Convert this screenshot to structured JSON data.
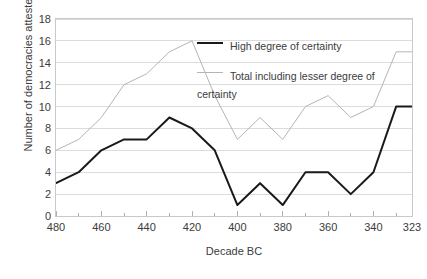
{
  "chart_data": {
    "type": "line",
    "title": "",
    "xlabel": "Decade BC",
    "ylabel": "Number of democracies attested",
    "xlim": [
      480,
      323
    ],
    "ylim": [
      0,
      18
    ],
    "ytick_step": 2,
    "grid": "horizontal",
    "legend_position": "inside-top-right",
    "x": [
      480,
      470,
      460,
      450,
      440,
      430,
      420,
      410,
      400,
      390,
      380,
      370,
      360,
      350,
      340,
      330,
      323
    ],
    "xtick_labels": [
      "480",
      "460",
      "440",
      "420",
      "400",
      "380",
      "360",
      "340",
      "323"
    ],
    "xtick_values": [
      480,
      460,
      440,
      420,
      400,
      380,
      360,
      340,
      323
    ],
    "ytick_labels": [
      "0",
      "2",
      "4",
      "6",
      "8",
      "10",
      "12",
      "14",
      "16",
      "18"
    ],
    "ytick_values": [
      0,
      2,
      4,
      6,
      8,
      10,
      12,
      14,
      16,
      18
    ],
    "series": [
      {
        "name": "High degree of certainty",
        "color": "#1a1a1a",
        "width": 2,
        "values": [
          3,
          4,
          6,
          7,
          7,
          9,
          8,
          6,
          1,
          3,
          1,
          4,
          4,
          2,
          4,
          10,
          10
        ]
      },
      {
        "name": "Total including lesser degree of certainty",
        "color": "#b5b5b5",
        "width": 1,
        "values": [
          6,
          7,
          9,
          12,
          13,
          15,
          16,
          11,
          7,
          9,
          7,
          10,
          11,
          9,
          10,
          15,
          15
        ]
      }
    ]
  },
  "legend": {
    "entries": [
      {
        "label": "High degree of certainty",
        "style": "thick"
      },
      {
        "label": "Total including lesser degree of certainty",
        "style": "thin"
      }
    ]
  },
  "axes": {
    "x_title": "Decade BC",
    "y_title": "Number of democracies attested"
  }
}
